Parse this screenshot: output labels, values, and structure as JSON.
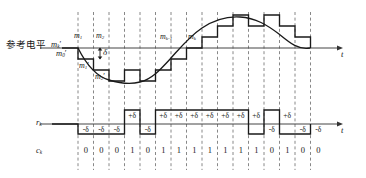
{
  "figure": {
    "title_text": "Delta modulation waveform diagram",
    "reference_level_label": "参考电平",
    "axis_label_t": "t"
  },
  "signal_labels": {
    "m_top": [
      {
        "text": "m",
        "sub": "1",
        "x": 78,
        "y": 36
      },
      {
        "text": "m",
        "sub": "2",
        "x": 100,
        "y": 36
      },
      {
        "text": "m",
        "sub": "k-1",
        "x": 164,
        "y": 37
      },
      {
        "text": "m",
        "sub": "k",
        "x": 190,
        "y": 37
      }
    ],
    "m_ref_k": {
      "text": "m",
      "sub": "k",
      "prime": "'"
    },
    "m_ref_0": {
      "text": "m",
      "sub": "0",
      "prime": "'"
    },
    "m_prime_1": {
      "text": "m",
      "sub": "1",
      "prime": "'"
    },
    "m_prime_2": {
      "text": "m",
      "sub": "2",
      "prime": "'"
    },
    "delta_marker": "δ"
  },
  "rows": {
    "rk_label": {
      "text": "r",
      "sub": "k"
    },
    "ck_label": {
      "text": "c",
      "sub": "k"
    }
  },
  "chart_data": {
    "type": "line",
    "xlabel": "t",
    "ylabel": "",
    "sample_count": 16,
    "bits": [
      "0",
      "0",
      "0",
      "1",
      "0",
      "1",
      "1",
      "1",
      "1",
      "1",
      "1",
      "1",
      "0",
      "1",
      "0",
      "0"
    ],
    "rk_values": [
      "-δ",
      "-δ",
      "-δ",
      "+δ",
      "-δ",
      "+δ",
      "+δ",
      "+δ",
      "+δ",
      "+δ",
      "+δ",
      "+δ",
      "-δ",
      "+δ",
      "-δ",
      "-δ"
    ],
    "rk_signs": [
      -1,
      -1,
      -1,
      1,
      -1,
      1,
      1,
      1,
      1,
      1,
      1,
      1,
      -1,
      1,
      -1,
      -1
    ],
    "staircase_levels": [
      -1,
      -2,
      -3,
      -2,
      -3,
      -2,
      -1,
      0,
      1,
      2,
      3,
      4,
      3,
      4,
      3,
      2
    ],
    "analog_curve": "sinusoid: m(t) starts at reference level, dips to minimum near sample 4, rises to maximum near sample 12, returns to reference",
    "delta_step": "δ",
    "grid": "dashed vertical sample boundaries",
    "legend": []
  },
  "colors": {
    "ink": "#1a1a1a",
    "dashed": "#6b6b6b",
    "axis": "#555555",
    "background": "#ffffff"
  }
}
